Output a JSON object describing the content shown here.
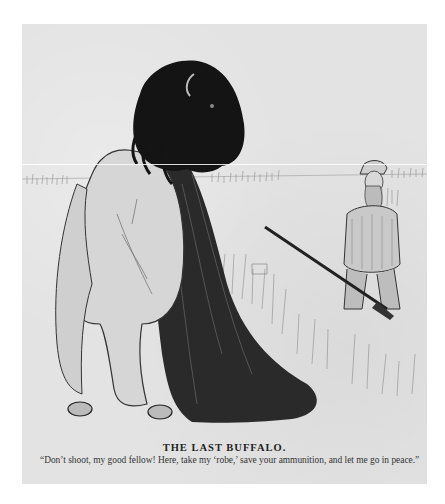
{
  "illustration": {
    "title": "THE LAST BUFFALO.",
    "caption": "“Don’t shoot, my good fellow!  Here, take my ‘robe,’ save your ammunition, and let me go in peace.”",
    "subjects": [
      "buffalo-removing-robe",
      "hunter-with-rifle",
      "prairie-grass"
    ],
    "colors": {
      "paper": "#e3e3e3",
      "ink": "#1a1a1a",
      "background": "#ffffff"
    }
  }
}
